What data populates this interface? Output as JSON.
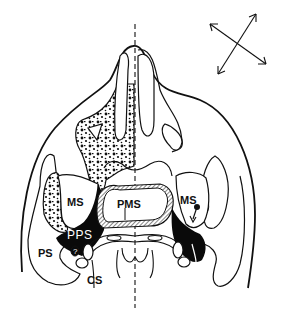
{
  "diagram": {
    "type": "anatomical cross-section",
    "colors": {
      "line": "#111111",
      "fill_dark": "#0a0a0a",
      "background": "#ffffff",
      "inverse_text": "#ffffff"
    },
    "labels": {
      "ms_left": "MS",
      "ms_right": "MS",
      "pms": "PMS",
      "pps": "PPS",
      "ps": "PS",
      "cs": "CS",
      "question_mark": "?"
    },
    "orientation_icon": "four-way-diagonal-arrows",
    "midline": "dashed vertical line"
  }
}
